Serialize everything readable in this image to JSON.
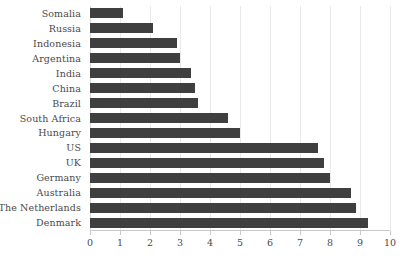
{
  "chart_data": {
    "type": "bar",
    "orientation": "horizontal",
    "title": "",
    "subtitle": "",
    "xlabel": "",
    "ylabel": "",
    "xlim": [
      0,
      10
    ],
    "ylim": null,
    "grid": true,
    "legend": null,
    "legend_position": "none",
    "xticks": [
      0,
      1,
      2,
      3,
      4,
      5,
      6,
      7,
      8,
      9,
      10
    ],
    "xtick_labels": [
      "0",
      "1",
      "2",
      "3",
      "4",
      "5",
      "6",
      "7",
      "8",
      "9",
      "10"
    ],
    "bar_color": "#3f3f3f",
    "grid_color": "#e9e9e9",
    "axis_color": "#c9c9c9",
    "text_color": "#4a4a4a",
    "categories": [
      "Somalia",
      "Russia",
      "Indonesia",
      "Argentina",
      "India",
      "China",
      "Brazil",
      "South Africa",
      "Hungary",
      "US",
      "UK",
      "Germany",
      "Australia",
      "The Netherlands",
      "Denmark"
    ],
    "values": [
      1.1,
      2.1,
      2.9,
      3.0,
      3.35,
      3.5,
      3.6,
      4.6,
      5.0,
      7.6,
      7.8,
      8.0,
      8.7,
      8.85,
      9.25
    ]
  }
}
